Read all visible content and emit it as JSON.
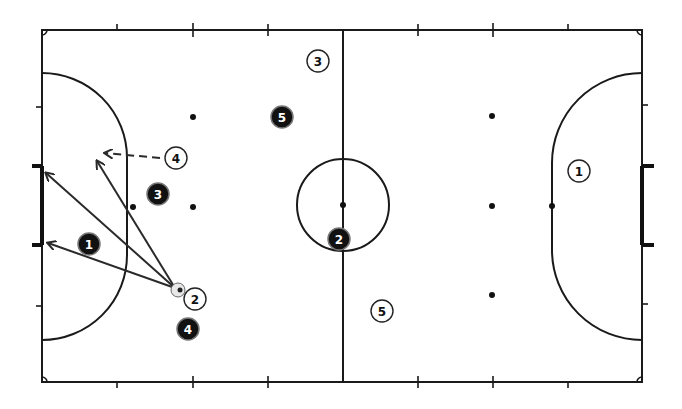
{
  "diagram": {
    "type": "futsal-court-tactic",
    "colors": {
      "line": "#1a1a1a",
      "background": "#ffffff",
      "white_player": "#ffffff",
      "black_player": "#111111"
    },
    "white_team": [
      {
        "number": "1",
        "x": 579,
        "y": 171
      },
      {
        "number": "2",
        "x": 195,
        "y": 299
      },
      {
        "number": "3",
        "x": 318,
        "y": 61
      },
      {
        "number": "4",
        "x": 176,
        "y": 158
      },
      {
        "number": "5",
        "x": 382,
        "y": 311
      }
    ],
    "black_team": [
      {
        "number": "1",
        "x": 89,
        "y": 244
      },
      {
        "number": "2",
        "x": 339,
        "y": 239
      },
      {
        "number": "3",
        "x": 158,
        "y": 194
      },
      {
        "number": "4",
        "x": 188,
        "y": 329
      },
      {
        "number": "5",
        "x": 282,
        "y": 117
      }
    ],
    "ball": {
      "x": 178,
      "y": 290
    },
    "passes": [
      {
        "type": "solid",
        "from": "ball",
        "to": "goal-top-post"
      },
      {
        "type": "solid",
        "from": "ball",
        "to": "goal-bottom-post"
      },
      {
        "type": "solid",
        "from": "ball",
        "to": "area-top"
      },
      {
        "type": "dashed",
        "from": "white-4",
        "to": "area-top-left"
      }
    ]
  }
}
